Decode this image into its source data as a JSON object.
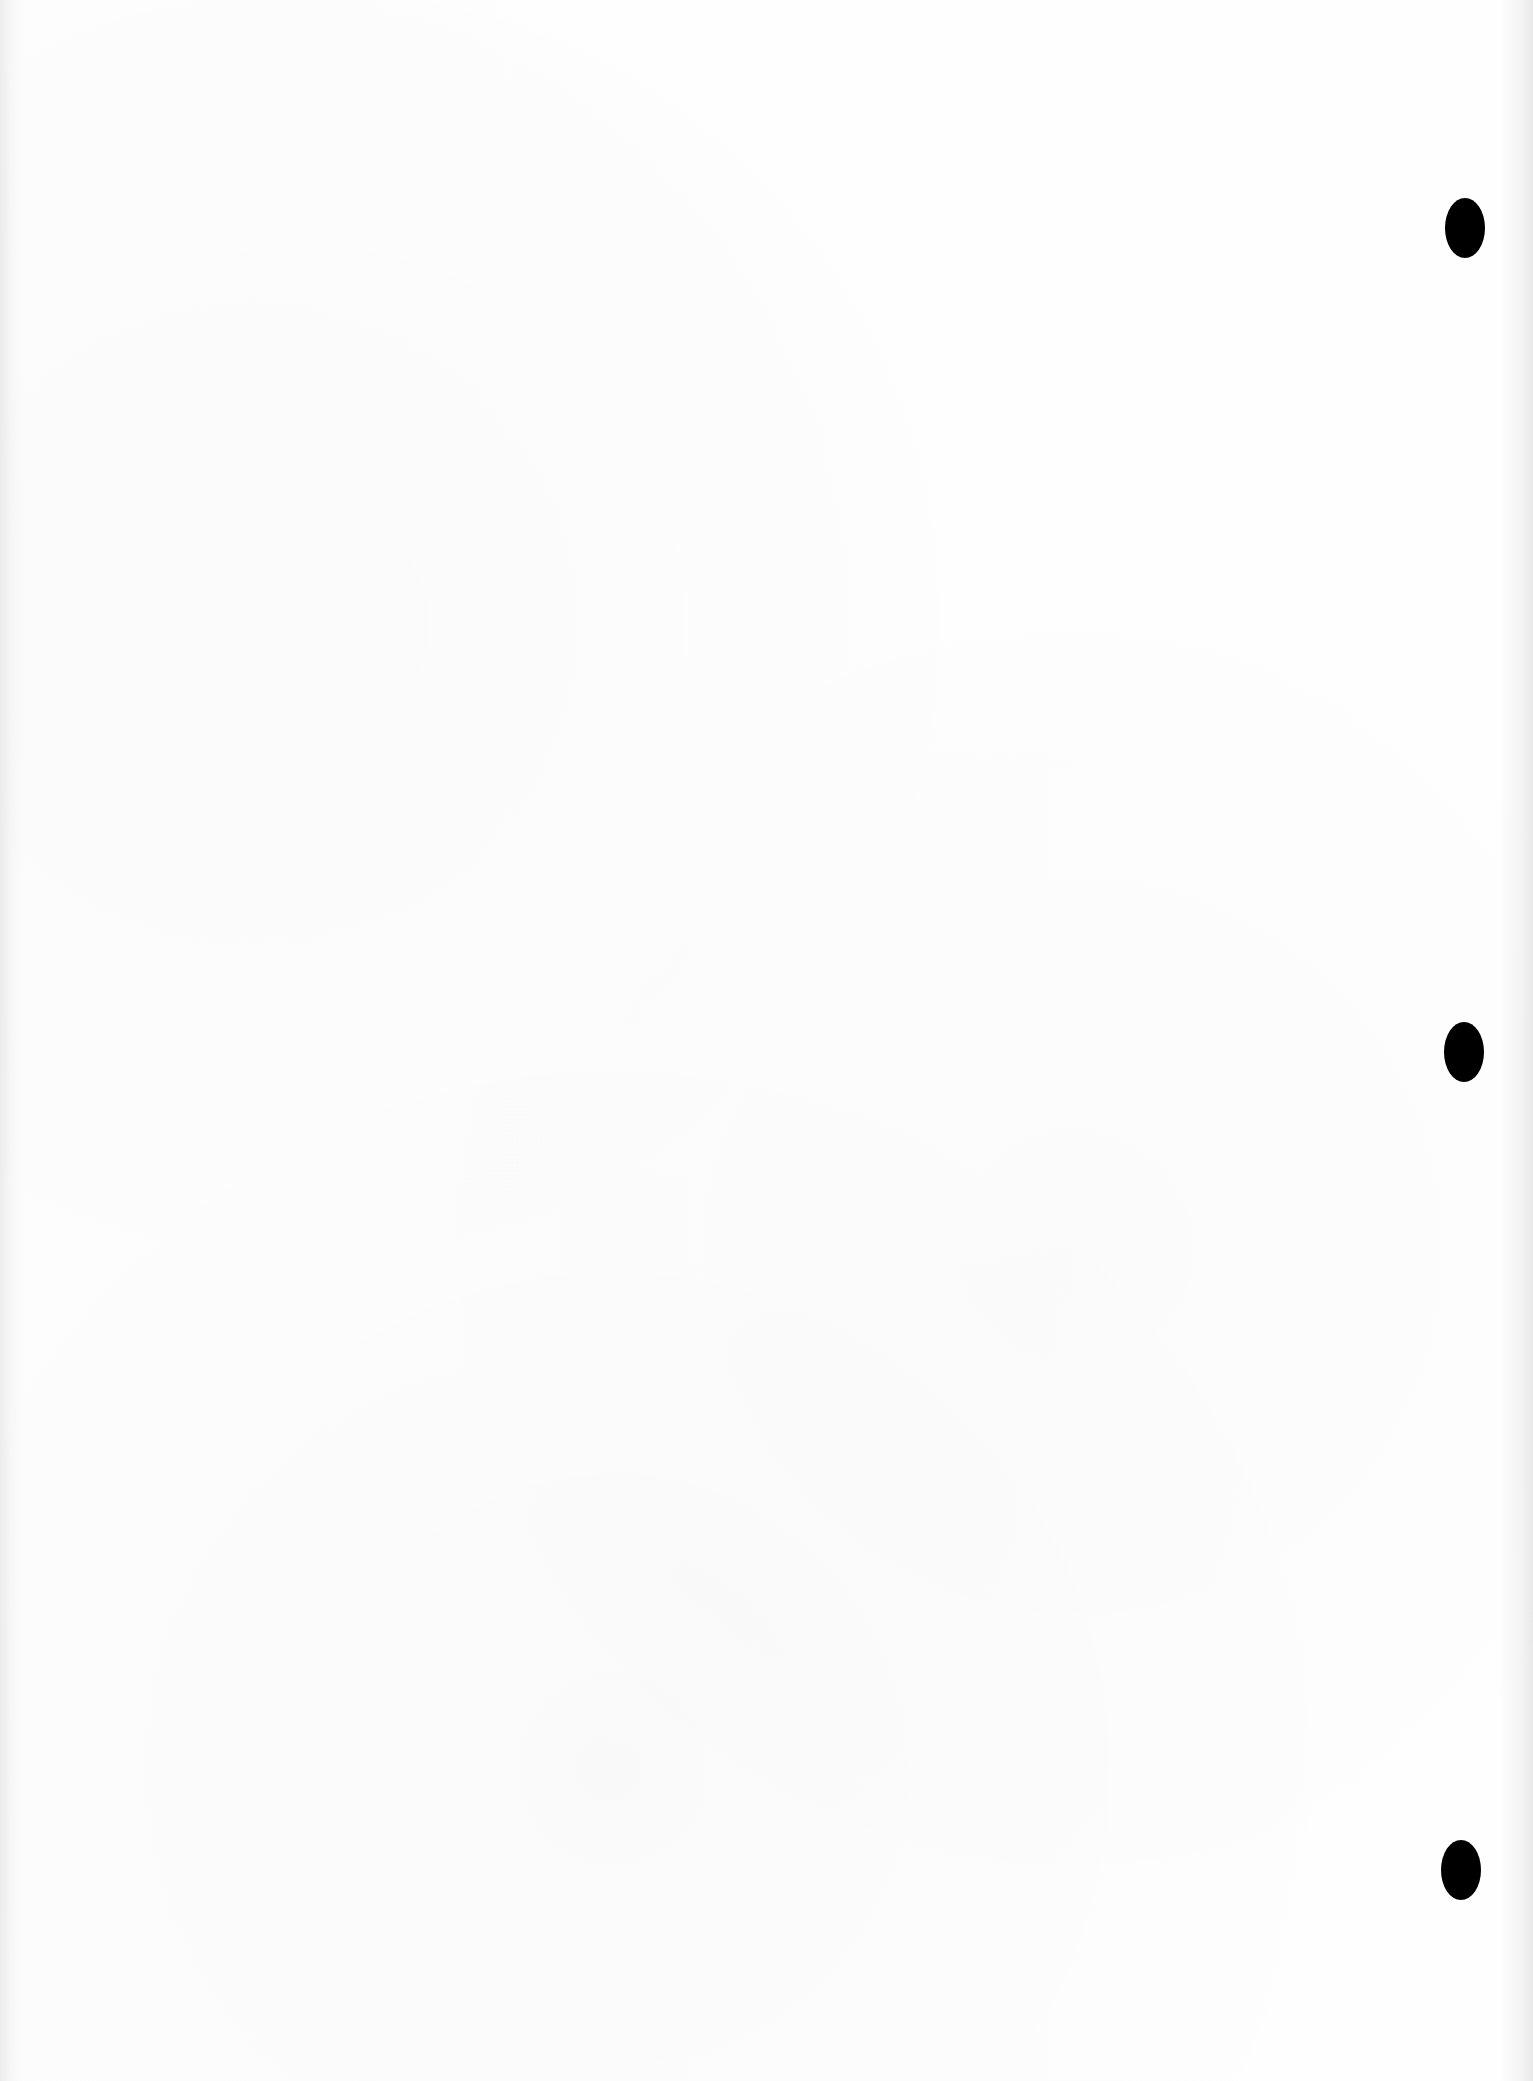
{
  "document": {
    "type": "blank scanned sheet",
    "text_content": "",
    "background_color": "#fdfdfd",
    "punch_holes": [
      {
        "id": "top",
        "cx": 1465,
        "cy": 228,
        "width": 40,
        "height": 60,
        "color": "#000000"
      },
      {
        "id": "middle",
        "cx": 1464,
        "cy": 1052,
        "width": 40,
        "height": 60,
        "color": "#000000"
      },
      {
        "id": "bottom",
        "cx": 1461,
        "cy": 1870,
        "width": 40,
        "height": 60,
        "color": "#000000"
      }
    ]
  }
}
